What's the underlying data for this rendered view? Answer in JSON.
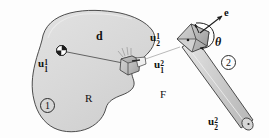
{
  "figure": {
    "background_color": "#fdfdfd",
    "body1": {
      "region_label": "R",
      "number_label": "1",
      "fill_color": "#d9d9d9",
      "stroke_color": "#3a3a3a"
    },
    "body2": {
      "region_label": "F",
      "number_label": "2",
      "rod_fill_color": "#cfcfcf",
      "block_fill_color": "#b9b9b9",
      "stroke_color": "#3a3a3a"
    },
    "vectors": {
      "u11": {
        "base": "u",
        "sub": "1",
        "sup": "1"
      },
      "u12": {
        "base": "u",
        "sub": "1",
        "sup": "2"
      },
      "u21": {
        "base": "u",
        "sub": "2",
        "sup": "1"
      },
      "u22": {
        "base": "u",
        "sub": "2",
        "sup": "2"
      },
      "d": "d",
      "e": "e",
      "theta": "θ"
    },
    "icons": {
      "origin_marker": "quadrant-disc-icon",
      "joint_marker": "dot-marker-icon",
      "rotation_arrow": "curved-rotation-arrow-icon",
      "axis_arrow": "e-axis-arrow-icon",
      "distance_line": "distance-line-icon"
    }
  }
}
